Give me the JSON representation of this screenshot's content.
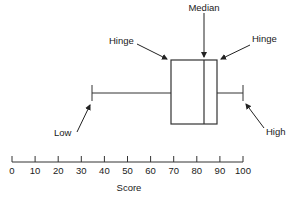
{
  "diagram": {
    "labels": {
      "median": "Median",
      "hinge_left": "Hinge",
      "hinge_right": "Hinge",
      "low": "Low",
      "high": "High"
    },
    "axis": {
      "label": "Score",
      "min": 0,
      "max": 100,
      "ticks": [
        "0",
        "10",
        "20",
        "30",
        "40",
        "50",
        "60",
        "70",
        "80",
        "90",
        "100"
      ]
    },
    "boxplot": {
      "low": 35,
      "lower_hinge": 69,
      "median": 83,
      "upper_hinge": 89,
      "high": 100
    },
    "colors": {
      "stroke": "#333333",
      "text": "#1a1a1a",
      "background": "#ffffff"
    }
  }
}
